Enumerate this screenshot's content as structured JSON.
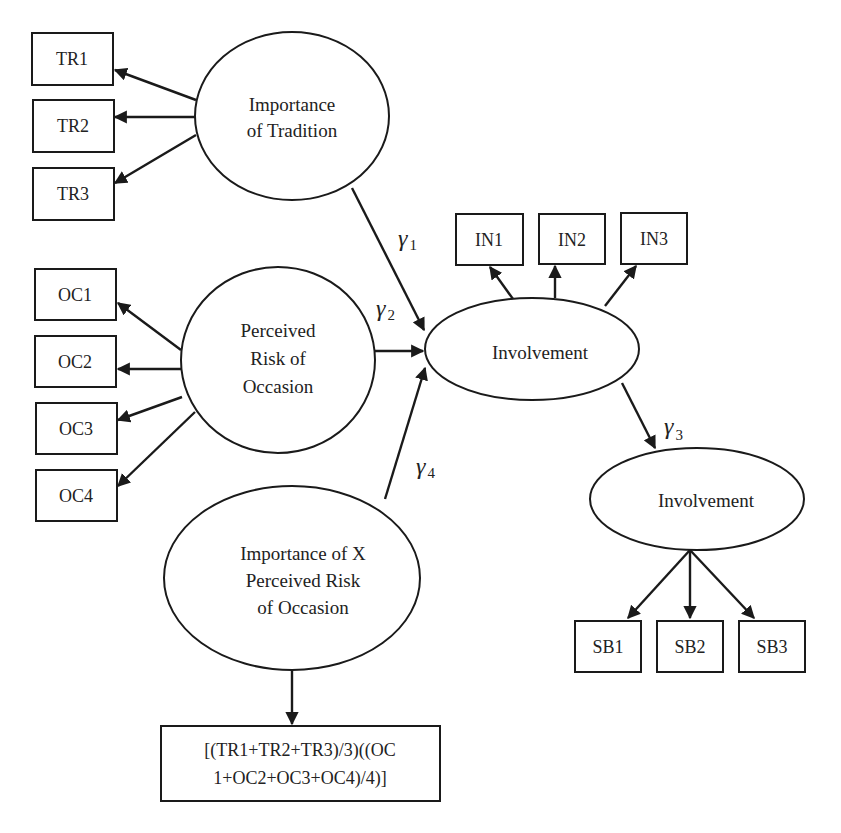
{
  "diagram": {
    "type": "structural-equation-model",
    "latents": {
      "tradition": {
        "lines": [
          "Importance",
          "of Tradition"
        ]
      },
      "risk": {
        "lines": [
          "Perceived",
          "Risk of",
          "Occasion"
        ]
      },
      "interaction": {
        "lines": [
          "Importance of X",
          "Perceived Risk",
          "of Occasion"
        ]
      },
      "involvement": {
        "lines": [
          "Involvement"
        ]
      },
      "outcome": {
        "lines": [
          "Involvement"
        ]
      }
    },
    "indicators": {
      "tradition": [
        "TR1",
        "TR2",
        "TR3"
      ],
      "risk": [
        "OC1",
        "OC2",
        "OC3",
        "OC4"
      ],
      "involvement": [
        "IN1",
        "IN2",
        "IN3"
      ],
      "outcome": [
        "SB1",
        "SB2",
        "SB3"
      ],
      "interaction_formula": [
        "[(TR1+TR2+TR3)/3)((OC",
        "1+OC2+OC3+OC4)/4)]"
      ]
    },
    "paths": [
      {
        "symbol": "γ",
        "subscript": "1",
        "from": "Importance of Tradition",
        "to": "Involvement"
      },
      {
        "symbol": "γ",
        "subscript": "2",
        "from": "Perceived Risk of Occasion",
        "to": "Involvement"
      },
      {
        "symbol": "γ",
        "subscript": "3",
        "from": "Involvement",
        "to": "Involvement (outcome)"
      },
      {
        "symbol": "γ",
        "subscript": "4",
        "from": "Importance of X Perceived Risk of Occasion",
        "to": "Involvement"
      }
    ],
    "colors": {
      "stroke": "#1a1a1a",
      "text": "#222222",
      "background": "#ffffff"
    }
  }
}
